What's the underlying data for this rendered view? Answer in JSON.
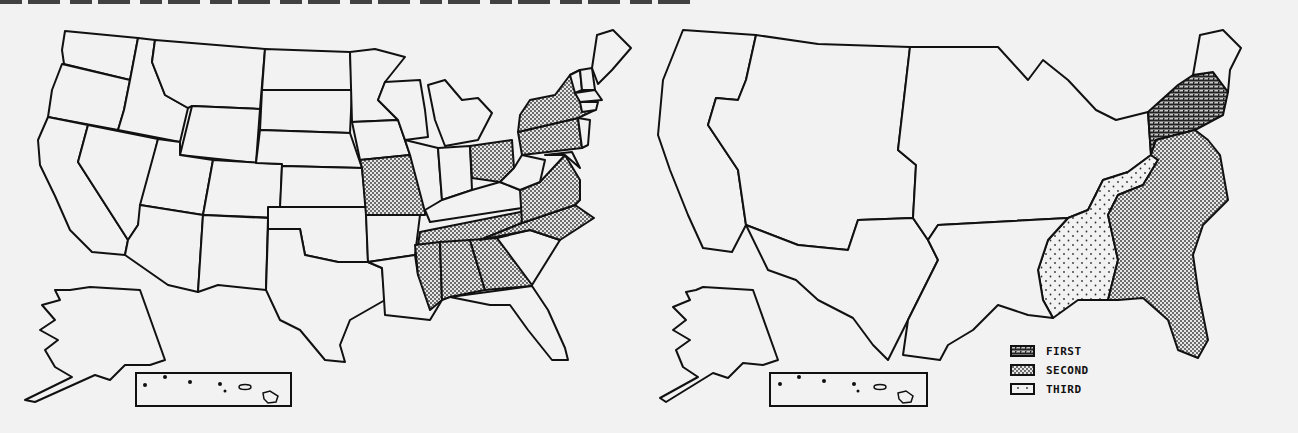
{
  "title": {
    "text": "",
    "note": "cropped-illegible"
  },
  "colors": {
    "background": "#f2f2f2",
    "outline": "#111111",
    "first_pattern": "#555555",
    "second_pattern": "#888888",
    "third_pattern": "#999999"
  },
  "left_map": {
    "name": "state map",
    "shaded_states": [
      "NY",
      "NJ",
      "PA",
      "OH",
      "MO",
      "VA",
      "NC",
      "TN",
      "MS",
      "AL",
      "GA"
    ],
    "inset": "hawaii-inset"
  },
  "right_map": {
    "name": "regional map",
    "regions": [
      {
        "name": "northeast",
        "fill": "first"
      },
      {
        "name": "southeast-coast",
        "fill": "second"
      },
      {
        "name": "south-central",
        "fill": "third"
      },
      {
        "name": "west-pacific",
        "fill": "none"
      },
      {
        "name": "mountain",
        "fill": "none"
      },
      {
        "name": "midwest",
        "fill": "none"
      },
      {
        "name": "south-west",
        "fill": "none"
      },
      {
        "name": "new-england",
        "fill": "none"
      }
    ],
    "inset": "hawaii-inset"
  },
  "legend": {
    "items": [
      {
        "label": "FIRST",
        "icon": "crosshatch-swatch"
      },
      {
        "label": "SECOND",
        "icon": "dense-dot-swatch"
      },
      {
        "label": "THIRD",
        "icon": "sparse-dot-swatch"
      }
    ]
  }
}
